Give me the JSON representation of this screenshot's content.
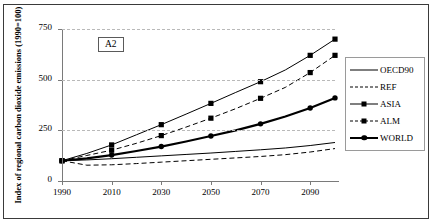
{
  "figure": {
    "scenario_badge": "A2",
    "y_axis_title": "Index of regional carbon dioxide emissions (1990=100)"
  },
  "legend": {
    "position": "right",
    "items": [
      {
        "label": "OECD90",
        "style": "solid-thin",
        "marker": "none",
        "color": "#000000"
      },
      {
        "label": "REF",
        "style": "dashed-thin",
        "marker": "none",
        "color": "#000000"
      },
      {
        "label": "ASIA",
        "style": "solid-thin",
        "marker": "square",
        "color": "#000000"
      },
      {
        "label": "ALM",
        "style": "dashed-thin",
        "marker": "square",
        "color": "#000000"
      },
      {
        "label": "WORLD",
        "style": "solid-thick",
        "marker": "circle",
        "color": "#000000"
      }
    ]
  },
  "chart_data": {
    "type": "line",
    "title": "",
    "subtitle": "",
    "annotations": [
      "A2"
    ],
    "xlabel": "",
    "ylabel": "Index of regional carbon dioxide emissions (1990=100)",
    "xlim": [
      1990,
      2100
    ],
    "ylim": [
      0,
      750
    ],
    "yticks": [
      0,
      250,
      500,
      750
    ],
    "xticks": [
      1990,
      2010,
      2030,
      2050,
      2070,
      2090
    ],
    "xtick_labels": [
      "1990",
      "2010",
      "2030",
      "2050",
      "2070",
      "2090"
    ],
    "ytick_labels": [
      "0",
      "250",
      "500",
      "750"
    ],
    "grid": "horizontal-dashed",
    "legend_position": "right",
    "x": [
      1990,
      2000,
      2010,
      2020,
      2030,
      2040,
      2050,
      2060,
      2070,
      2080,
      2090,
      2100
    ],
    "series": [
      {
        "name": "OECD90",
        "style": "solid-thin",
        "marker": "none",
        "values": [
          100,
          104,
          110,
          117,
          124,
          131,
          138,
          146,
          154,
          163,
          175,
          190
        ]
      },
      {
        "name": "REF",
        "style": "dashed-thin",
        "marker": "none",
        "values": [
          100,
          78,
          80,
          86,
          93,
          100,
          107,
          114,
          121,
          130,
          143,
          160
        ]
      },
      {
        "name": "ASIA",
        "style": "solid-thin",
        "marker": "square",
        "values": [
          100,
          136,
          178,
          228,
          278,
          330,
          383,
          437,
          490,
          548,
          620,
          700
        ]
      },
      {
        "name": "ALM",
        "style": "dashed-thin",
        "marker": "square",
        "values": [
          100,
          126,
          152,
          186,
          224,
          266,
          310,
          357,
          408,
          462,
          535,
          620
        ]
      },
      {
        "name": "WORLD",
        "style": "solid-thick",
        "marker": "circle",
        "values": [
          100,
          112,
          128,
          148,
          170,
          195,
          222,
          250,
          282,
          318,
          360,
          410
        ]
      }
    ]
  }
}
